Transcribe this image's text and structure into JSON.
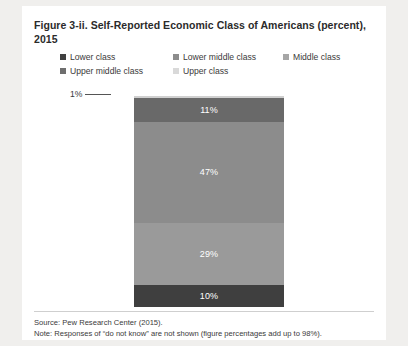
{
  "figure": {
    "title": "Figure 3-ii. Self-Reported Economic Class of Americans (percent), 2015",
    "source": "Source: Pew Research Center (2015).",
    "note": "Note: Responses of “do not know” are not shown (figure percentages add up to 98%)."
  },
  "legend": {
    "row1": [
      {
        "label": "Lower class",
        "color": "#404040"
      },
      {
        "label": "Lower middle class",
        "color": "#8c8c8c"
      },
      {
        "label": "Middle class",
        "color": "#a6a6a6"
      }
    ],
    "row2": [
      {
        "label": "Upper middle class",
        "color": "#6e6e6e"
      },
      {
        "label": "Upper class",
        "color": "#d9d9d9"
      }
    ]
  },
  "callout": {
    "label": "1%"
  },
  "chart_data": {
    "type": "bar",
    "subtype": "stacked-single-bar-100",
    "title": "Figure 3-ii. Self-Reported Economic Class of Americans (percent), 2015",
    "xlabel": "",
    "ylabel": "",
    "ylim": [
      0,
      100
    ],
    "grid": false,
    "legend_position": "top",
    "categories": [
      "2015"
    ],
    "segments_bottom_to_top": [
      {
        "name": "Lower class",
        "value": 10,
        "label": "10%",
        "color": "#3f3f3f",
        "label_shown": true
      },
      {
        "name": "Lower middle class",
        "value": 29,
        "label": "29%",
        "color": "#9a9a9a",
        "label_shown": true
      },
      {
        "name": "Middle class",
        "value": 47,
        "label": "47%",
        "color": "#8c8c8c",
        "label_shown": true
      },
      {
        "name": "Upper middle class",
        "value": 11,
        "label": "11%",
        "color": "#696969",
        "label_shown": true
      },
      {
        "name": "Upper class",
        "value": 1,
        "label": "1%",
        "color": "#d0d0d0",
        "label_shown": false
      }
    ],
    "total": 98,
    "annotations": [
      "1%"
    ],
    "source": "Source: Pew Research Center (2015).",
    "note": "Note: Responses of “do not know” are not shown (figure percentages add up to 98%)."
  }
}
